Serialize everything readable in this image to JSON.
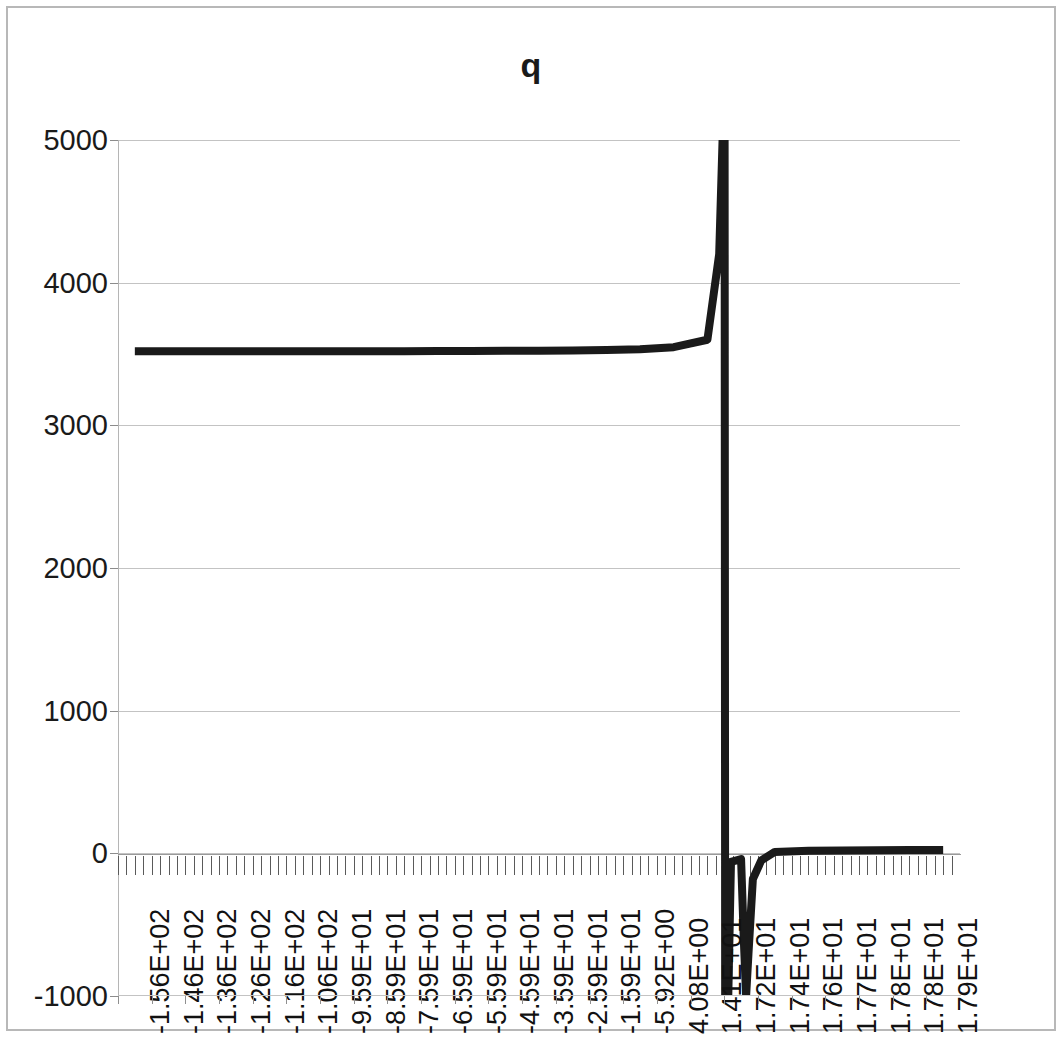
{
  "chart_data": {
    "type": "line",
    "title": "q",
    "xlabel": "",
    "ylabel": "",
    "ylim": [
      -1000,
      5000
    ],
    "y_ticks": [
      "5000",
      "4000",
      "3000",
      "2000",
      "1000",
      "0",
      "-1000"
    ],
    "y_tick_values": [
      5000,
      4000,
      3000,
      2000,
      1000,
      0,
      -1000
    ],
    "grid": true,
    "legend": false,
    "legend_position": "none",
    "x_tick_labels": [
      "-1.56E+02",
      "-1.46E+02",
      "-1.36E+02",
      "-1.26E+02",
      "-1.16E+02",
      "-1.06E+02",
      "-9.59E+01",
      "-8.59E+01",
      "-7.59E+01",
      "-6.59E+01",
      "-5.59E+01",
      "-4.59E+01",
      "-3.59E+01",
      "-2.59E+01",
      "-1.59E+01",
      "-5.92E+00",
      "4.08E+00",
      "1.41E+01",
      "1.72E+01",
      "1.74E+01",
      "1.76E+01",
      "1.77E+01",
      "1.78E+01",
      "1.78E+01",
      "1.79E+01"
    ],
    "x_tick_values": [
      -156,
      -146,
      -136,
      -126,
      -116,
      -106,
      -95.9,
      -85.9,
      -75.9,
      -65.9,
      -55.9,
      -45.9,
      -35.9,
      -25.9,
      -15.9,
      -5.92,
      4.08,
      14.1,
      17.2,
      17.4,
      17.6,
      17.7,
      17.8,
      17.8,
      17.9
    ],
    "series": [
      {
        "name": "q",
        "color": "#1a1a1a",
        "line_width": 8,
        "description": "Near-constant plateau at about 3520 across the left portion, then a near-vertical asymptotic rise past 5000 and an immediate plunge below -1000 just after 1.41E+01, recovering to a shallow negative trough and settling slightly above 0 for the remaining right-hand points.",
        "points": [
          {
            "xi": 0,
            "y": 3520
          },
          {
            "xi": 1,
            "y": 3520
          },
          {
            "xi": 2,
            "y": 3520
          },
          {
            "xi": 3,
            "y": 3520
          },
          {
            "xi": 4,
            "y": 3520
          },
          {
            "xi": 5,
            "y": 3520
          },
          {
            "xi": 6,
            "y": 3520
          },
          {
            "xi": 7,
            "y": 3520
          },
          {
            "xi": 8,
            "y": 3520
          },
          {
            "xi": 9,
            "y": 3521
          },
          {
            "xi": 10,
            "y": 3521
          },
          {
            "xi": 11,
            "y": 3522
          },
          {
            "xi": 12,
            "y": 3523
          },
          {
            "xi": 13,
            "y": 3525
          },
          {
            "xi": 14,
            "y": 3528
          },
          {
            "xi": 15,
            "y": 3534
          },
          {
            "xi": 16,
            "y": 3548
          },
          {
            "xi": 17,
            "y": 3600
          },
          {
            "xi": 17.35,
            "y": 4200
          },
          {
            "xi": 17.45,
            "y": 5000
          },
          {
            "xi": 17.5,
            "y": 9000
          },
          {
            "xi": 17.55,
            "y": -9000
          },
          {
            "xi": 17.62,
            "y": -1000
          },
          {
            "xi": 17.7,
            "y": -60
          },
          {
            "xi": 18,
            "y": -40
          },
          {
            "xi": 18.08,
            "y": -600
          },
          {
            "xi": 18.15,
            "y": -1000
          },
          {
            "xi": 18.22,
            "y": -700
          },
          {
            "xi": 18.35,
            "y": -180
          },
          {
            "xi": 18.6,
            "y": -50
          },
          {
            "xi": 19,
            "y": 10
          },
          {
            "xi": 20,
            "y": 18
          },
          {
            "xi": 21,
            "y": 20
          },
          {
            "xi": 22,
            "y": 22
          },
          {
            "xi": 23,
            "y": 23
          },
          {
            "xi": 24,
            "y": 24
          }
        ]
      }
    ]
  }
}
